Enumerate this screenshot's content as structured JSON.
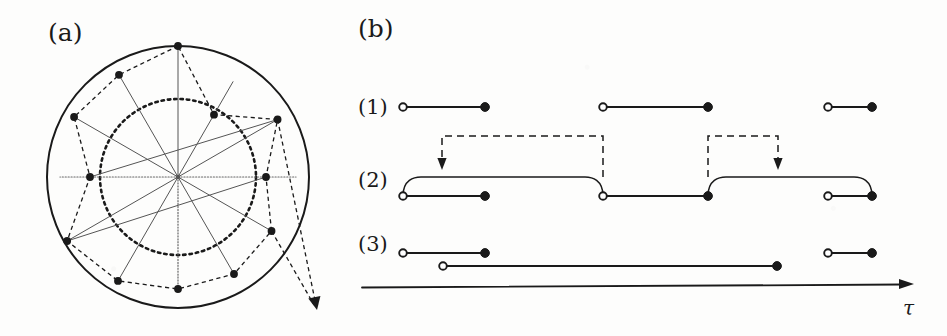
{
  "figure": {
    "panels": [
      {
        "id": "a",
        "label": "(a)",
        "x": 48,
        "y": 18
      },
      {
        "id": "b",
        "label": "(b)",
        "x": 358,
        "y": 14
      }
    ]
  },
  "panel_a": {
    "caption": "(a)",
    "outer_circle": {
      "cx": 178,
      "cy": 177,
      "r": 131,
      "style": "solid",
      "color": "#1a1a1a",
      "width": 2.0
    },
    "inner_circle": {
      "cx": 178,
      "cy": 177,
      "r": 78,
      "style": "dotted",
      "color": "#1a1a1a",
      "width": 2.6
    },
    "center": {
      "cx": 178,
      "cy": 177
    },
    "spoke_count": 12,
    "spokes": [
      {
        "angle_deg": -90,
        "r": 131,
        "style": "solid",
        "color": "#555555",
        "width": 1.0
      },
      {
        "angle_deg": -60,
        "r": 110,
        "style": "solid",
        "color": "#555555",
        "width": 1.0
      },
      {
        "angle_deg": -30,
        "r": 115,
        "style": "solid",
        "color": "#555555",
        "width": 1.0
      },
      {
        "angle_deg": 0,
        "r": 118,
        "style": "dotted",
        "color": "#666666",
        "width": 1.2
      },
      {
        "angle_deg": 30,
        "r": 108,
        "style": "solid",
        "color": "#555555",
        "width": 1.0
      },
      {
        "angle_deg": 60,
        "r": 112,
        "style": "solid",
        "color": "#555555",
        "width": 1.0
      },
      {
        "angle_deg": 90,
        "r": 112,
        "style": "dotted",
        "color": "#666666",
        "width": 1.2
      },
      {
        "angle_deg": 120,
        "r": 120,
        "style": "solid",
        "color": "#555555",
        "width": 1.0
      },
      {
        "angle_deg": 150,
        "r": 128,
        "style": "solid",
        "color": "#555555",
        "width": 1.0
      },
      {
        "angle_deg": 180,
        "r": 118,
        "style": "dotted",
        "color": "#666666",
        "width": 1.2
      },
      {
        "angle_deg": -150,
        "r": 120,
        "style": "solid",
        "color": "#555555",
        "width": 1.0
      },
      {
        "angle_deg": -120,
        "r": 118,
        "style": "solid",
        "color": "#555555",
        "width": 1.0
      }
    ],
    "trajectory": {
      "style": "dashed",
      "color": "#1a1a1a",
      "width": 1.3,
      "marker": "filled-square-dot",
      "marker_size": 5.0,
      "points": [
        {
          "angle_deg": -90,
          "r": 131
        },
        {
          "angle_deg": -120,
          "r": 118
        },
        {
          "angle_deg": -150,
          "r": 120
        },
        {
          "angle_deg": 180,
          "r": 88
        },
        {
          "angle_deg": 150,
          "r": 128
        },
        {
          "angle_deg": 120,
          "r": 120
        },
        {
          "angle_deg": 90,
          "r": 112
        },
        {
          "angle_deg": 60,
          "r": 112
        },
        {
          "angle_deg": 30,
          "r": 108
        },
        {
          "angle_deg": 0,
          "r": 88
        },
        {
          "angle_deg": -30,
          "r": 115
        },
        {
          "angle_deg": -60,
          "r": 72
        }
      ],
      "exit_arrow": {
        "x": 317,
        "y": 310,
        "from_indices": [
          8,
          10
        ]
      }
    },
    "chord_lines": [
      {
        "from_index": 3,
        "to_index": 10,
        "style": "solid",
        "color": "#555555",
        "width": 1.0
      },
      {
        "from_index": 4,
        "to_index": 9,
        "style": "solid",
        "color": "#555555",
        "width": 1.0
      }
    ]
  },
  "panel_b": {
    "caption": "(b)",
    "axis": {
      "label": "τ",
      "label_x": 903,
      "label_y": 300,
      "x_start": 362,
      "x_end": 914,
      "y": 286,
      "arrowhead": true,
      "color": "#1a1a1a",
      "width": 1.8
    },
    "marker_open": "open-circle",
    "marker_filled": "filled-circle",
    "rows": [
      {
        "id": "row-1",
        "label": "(1)",
        "label_x": 358,
        "label_y": 96,
        "baseline_y": 107,
        "intervals": [
          {
            "start": 403,
            "end": 485,
            "start_marker": "open-circle",
            "end_marker": "filled-circle",
            "y": 107
          },
          {
            "start": 603,
            "end": 708,
            "start_marker": "open-circle",
            "end_marker": "filled-circle",
            "y": 107
          },
          {
            "start": 828,
            "end": 872,
            "start_marker": "open-circle",
            "end_marker": "filled-circle",
            "y": 107
          }
        ]
      },
      {
        "id": "row-2",
        "label": "(2)",
        "label_x": 358,
        "label_y": 180,
        "baseline_y": 196,
        "intervals": [
          {
            "start": 403,
            "end": 485,
            "start_marker": "open-circle",
            "end_marker": "filled-circle",
            "y": 196
          },
          {
            "start": 603,
            "end": 708,
            "start_marker": "open-circle",
            "end_marker": "filled-circle",
            "y": 196
          },
          {
            "start": 828,
            "end": 872,
            "start_marker": "open-circle",
            "end_marker": "filled-circle",
            "y": 196
          }
        ],
        "bridges": [
          {
            "from_x": 403,
            "to_x": 603,
            "top_y": 177,
            "baseline_y": 196
          },
          {
            "from_x": 708,
            "to_x": 872,
            "top_y": 177,
            "baseline_y": 196
          }
        ],
        "dashed_arrows": [
          {
            "origin_x": 603,
            "arrow_x": 442,
            "top_y": 136,
            "tip_y": 170
          },
          {
            "origin_x": 708,
            "arrow_x": 778,
            "top_y": 136,
            "tip_y": 170
          }
        ]
      },
      {
        "id": "row-3",
        "label": "(3)",
        "label_x": 358,
        "label_y": 243,
        "baseline_y": 253,
        "intervals": [
          {
            "start": 403,
            "end": 485,
            "start_marker": "open-circle",
            "end_marker": "filled-circle",
            "y": 253
          },
          {
            "start": 828,
            "end": 872,
            "start_marker": "open-circle",
            "end_marker": "filled-circle",
            "y": 253
          },
          {
            "start": 443,
            "end": 777,
            "start_marker": "open-circle",
            "end_marker": "filled-circle",
            "y": 266
          }
        ]
      }
    ]
  },
  "style": {
    "ink": "#1a1a1a",
    "faint_ink": "#555555",
    "paper": "#fdfdfc",
    "line_width": 1.8,
    "marker_radius": 4.4
  }
}
